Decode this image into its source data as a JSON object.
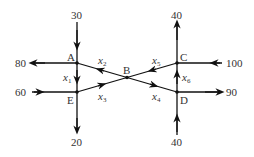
{
  "diagram": {
    "type": "traffic-flow-network",
    "nodes": [
      {
        "id": "A",
        "label": "A"
      },
      {
        "id": "B",
        "label": "B"
      },
      {
        "id": "C",
        "label": "C"
      },
      {
        "id": "D",
        "label": "D"
      },
      {
        "id": "E",
        "label": "E"
      }
    ],
    "external_flows": [
      {
        "node": "A",
        "value": "30",
        "direction": "in",
        "side": "top"
      },
      {
        "node": "A",
        "value": "80",
        "direction": "out",
        "side": "left"
      },
      {
        "node": "E",
        "value": "60",
        "direction": "in",
        "side": "left"
      },
      {
        "node": "E",
        "value": "20",
        "direction": "out",
        "side": "bottom"
      },
      {
        "node": "C",
        "value": "40",
        "direction": "out",
        "side": "top"
      },
      {
        "node": "C",
        "value": "100",
        "direction": "in",
        "side": "right"
      },
      {
        "node": "D",
        "value": "90",
        "direction": "out",
        "side": "right"
      },
      {
        "node": "D",
        "value": "40",
        "direction": "in",
        "side": "bottom"
      }
    ],
    "internal_flows": [
      {
        "var": "x",
        "sub": "1",
        "from": "A",
        "to": "E"
      },
      {
        "var": "x",
        "sub": "2",
        "from": "B",
        "to": "A"
      },
      {
        "var": "x",
        "sub": "3",
        "from": "E",
        "to": "B"
      },
      {
        "var": "x",
        "sub": "4",
        "from": "B",
        "to": "D"
      },
      {
        "var": "x",
        "sub": "5",
        "from": "C",
        "to": "B"
      },
      {
        "var": "x",
        "sub": "6",
        "from": "D",
        "to": "C"
      }
    ]
  },
  "labels": {
    "a": "A",
    "b": "B",
    "c": "C",
    "d": "D",
    "e": "E",
    "in_top_a": "30",
    "out_left_a": "80",
    "in_left_e": "60",
    "out_bottom_e": "20",
    "out_top_c": "40",
    "in_right_c": "100",
    "out_right_d": "90",
    "in_bottom_d": "40",
    "x": "x",
    "s1": "1",
    "s2": "2",
    "s3": "3",
    "s4": "4",
    "s5": "5",
    "s6": "6"
  },
  "colors": {
    "line": "#111111",
    "text": "#333333"
  }
}
